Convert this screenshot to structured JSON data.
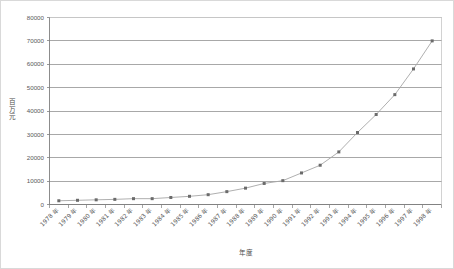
{
  "chart_data": {
    "type": "line",
    "title": "",
    "xlabel": "年度",
    "ylabel": "百万元",
    "categories": [
      "1978 年",
      "1979 年",
      "1980 年",
      "1981 年",
      "1982 年",
      "1983 年",
      "1984 年",
      "1985 年",
      "1986 年",
      "1987 年",
      "1988 年",
      "1989 年",
      "1990 年",
      "1991 年",
      "1992 年",
      "1993 年",
      "1994 年",
      "1995 年",
      "1996 年",
      "1997 年",
      "1998 年"
    ],
    "values": [
      1600,
      1800,
      2000,
      2200,
      2500,
      2500,
      3000,
      3500,
      4200,
      5500,
      7000,
      9000,
      10200,
      13500,
      16800,
      22500,
      30800,
      38500,
      47000,
      58000,
      70000
    ],
    "series": [
      {
        "name": "",
        "values": [
          1600,
          1800,
          2000,
          2200,
          2500,
          2500,
          3000,
          3500,
          4200,
          5500,
          7000,
          9000,
          10200,
          13500,
          16800,
          22500,
          30800,
          38500,
          47000,
          58000,
          70000
        ]
      }
    ],
    "ytick_labels": [
      "0",
      "10000",
      "20000",
      "30000",
      "40000",
      "50000",
      "60000",
      "70000",
      "80000"
    ],
    "ytick_values": [
      0,
      10000,
      20000,
      30000,
      40000,
      50000,
      60000,
      70000,
      80000
    ],
    "ylim": [
      0,
      80000
    ],
    "grid": "horizontal",
    "legend": "none",
    "line_color": "#a6a6a6",
    "marker_color": "#6b6b6b",
    "grid_color": "#808080",
    "axis_color": "#808080",
    "border_color": "#d9d9d9"
  }
}
